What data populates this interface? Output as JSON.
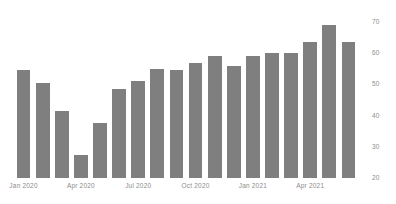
{
  "chart_data": {
    "type": "bar",
    "title": "",
    "subtitle": "",
    "xlabel": "",
    "ylabel": "",
    "grid": false,
    "legend": null,
    "bar_color": "#7f7f7f",
    "axis_label_color": "#8c8c8c",
    "y_axis_position": "right",
    "ylim": [
      20,
      70
    ],
    "y_ticks": [
      20,
      30,
      40,
      50,
      60,
      70
    ],
    "y_tick_labels": [
      "20",
      "30",
      "40",
      "50",
      "60",
      "70"
    ],
    "x_tick_labels": [
      "Jan 2020",
      "Apr 2020",
      "Jul 2020",
      "Oct 2020",
      "Jan 2021",
      "Apr 2021"
    ],
    "x_tick_indices": [
      0,
      3,
      6,
      9,
      12,
      15
    ],
    "categories": [
      "Jan 2020",
      "Feb 2020",
      "Mar 2020",
      "Apr 2020",
      "May 2020",
      "Jun 2020",
      "Jul 2020",
      "Aug 2020",
      "Sep 2020",
      "Oct 2020",
      "Nov 2020",
      "Dec 2020",
      "Jan 2021",
      "Feb 2021",
      "Mar 2021",
      "Apr 2021",
      "May 2021",
      "Jun 2021"
    ],
    "values": [
      54.5,
      50.5,
      41.5,
      27.5,
      37.5,
      48.5,
      51.0,
      55.0,
      54.5,
      57.0,
      59.0,
      56.0,
      59.0,
      60.0,
      60.0,
      63.5,
      69.0,
      63.5
    ]
  }
}
